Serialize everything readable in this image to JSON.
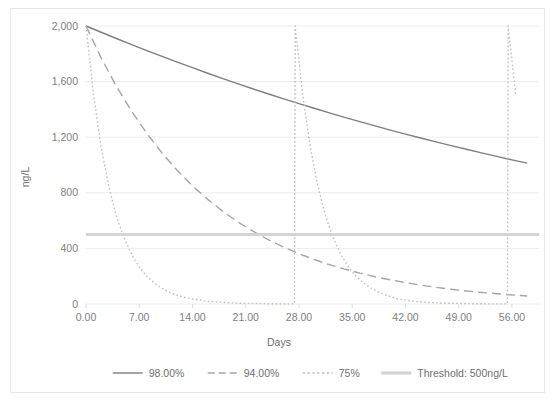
{
  "chart_data": {
    "type": "line",
    "title": "",
    "xlabel": "Days",
    "ylabel": "ng/L",
    "xlim": [
      0,
      58.5
    ],
    "ylim": [
      0,
      2000
    ],
    "xticks": [
      "0.00",
      "7.00",
      "14.00",
      "21.00",
      "28.00",
      "35.00",
      "42.00",
      "49.00",
      "56.00"
    ],
    "xtick_values": [
      0,
      7,
      14,
      21,
      28,
      35,
      42,
      49,
      56
    ],
    "yticks": [
      "0",
      "400",
      "800",
      "1,200",
      "1,600",
      "2,000"
    ],
    "ytick_values": [
      0,
      400,
      800,
      1200,
      1600,
      2000
    ],
    "grid": "horizontal",
    "legend_position": "bottom",
    "series": [
      {
        "name": "98.00%",
        "style": "solid",
        "color": "#7f7f7f",
        "width": 1.4,
        "points": [
          [
            0,
            2000
          ],
          [
            2,
            1955
          ],
          [
            4,
            1910
          ],
          [
            6,
            1866
          ],
          [
            8,
            1823
          ],
          [
            10,
            1781
          ],
          [
            12,
            1740
          ],
          [
            14,
            1700
          ],
          [
            16,
            1660
          ],
          [
            18,
            1622
          ],
          [
            20,
            1584
          ],
          [
            22,
            1547
          ],
          [
            24,
            1511
          ],
          [
            26,
            1476
          ],
          [
            28,
            1442
          ],
          [
            30,
            1408
          ],
          [
            32,
            1375
          ],
          [
            34,
            1343
          ],
          [
            36,
            1312
          ],
          [
            38,
            1281
          ],
          [
            40,
            1251
          ],
          [
            42,
            1222
          ],
          [
            44,
            1194
          ],
          [
            46,
            1166
          ],
          [
            48,
            1139
          ],
          [
            50,
            1113
          ],
          [
            52,
            1087
          ],
          [
            54,
            1062
          ],
          [
            56,
            1037
          ],
          [
            58,
            1013
          ]
        ]
      },
      {
        "name": "94.00%",
        "style": "dashed",
        "color": "#a6a6a6",
        "width": 1.4,
        "points": [
          [
            0,
            2000
          ],
          [
            2,
            1770
          ],
          [
            4,
            1566
          ],
          [
            6,
            1386
          ],
          [
            8,
            1227
          ],
          [
            10,
            1086
          ],
          [
            12,
            961
          ],
          [
            14,
            850
          ],
          [
            16,
            753
          ],
          [
            18,
            666
          ],
          [
            20,
            589
          ],
          [
            22,
            522
          ],
          [
            24,
            462
          ],
          [
            26,
            409
          ],
          [
            28,
            362
          ],
          [
            30,
            320
          ],
          [
            32,
            283
          ],
          [
            34,
            251
          ],
          [
            36,
            222
          ],
          [
            38,
            196
          ],
          [
            40,
            174
          ],
          [
            42,
            154
          ],
          [
            44,
            136
          ],
          [
            46,
            120
          ],
          [
            48,
            106
          ],
          [
            50,
            94
          ],
          [
            52,
            83
          ],
          [
            54,
            74
          ],
          [
            56,
            65
          ],
          [
            58,
            58
          ]
        ]
      },
      {
        "name": "75%",
        "style": "dotted",
        "color": "#bfbfbf",
        "width": 1.4,
        "points": [
          [
            0,
            2000
          ],
          [
            1,
            1500
          ],
          [
            2,
            1125
          ],
          [
            3,
            844
          ],
          [
            4,
            633
          ],
          [
            5,
            475
          ],
          [
            6,
            356
          ],
          [
            7,
            267
          ],
          [
            8,
            200
          ],
          [
            9,
            150
          ],
          [
            10,
            113
          ],
          [
            11,
            84
          ],
          [
            12,
            63
          ],
          [
            13,
            47
          ],
          [
            14,
            36
          ],
          [
            16,
            20
          ],
          [
            18,
            11
          ],
          [
            20,
            6
          ],
          [
            22,
            4
          ],
          [
            24,
            2
          ],
          [
            26,
            1
          ],
          [
            27.4,
            1
          ],
          [
            27.5,
            2000
          ],
          [
            28.5,
            1500
          ],
          [
            29.5,
            1125
          ],
          [
            30.5,
            844
          ],
          [
            31.5,
            633
          ],
          [
            32.5,
            475
          ],
          [
            33.5,
            356
          ],
          [
            34.5,
            267
          ],
          [
            35.5,
            200
          ],
          [
            36.5,
            150
          ],
          [
            37.5,
            113
          ],
          [
            38.5,
            84
          ],
          [
            39.5,
            63
          ],
          [
            41,
            36
          ],
          [
            43,
            20
          ],
          [
            45,
            11
          ],
          [
            47,
            6
          ],
          [
            49,
            4
          ],
          [
            51,
            2
          ],
          [
            53,
            1
          ],
          [
            55.4,
            1
          ],
          [
            55.5,
            2000
          ],
          [
            56.5,
            1500
          ]
        ]
      }
    ],
    "threshold": {
      "name": "Threshold: 500ng/L",
      "value": 500,
      "style": "solid",
      "color": "#d4d4d4",
      "width": 3.2
    }
  }
}
